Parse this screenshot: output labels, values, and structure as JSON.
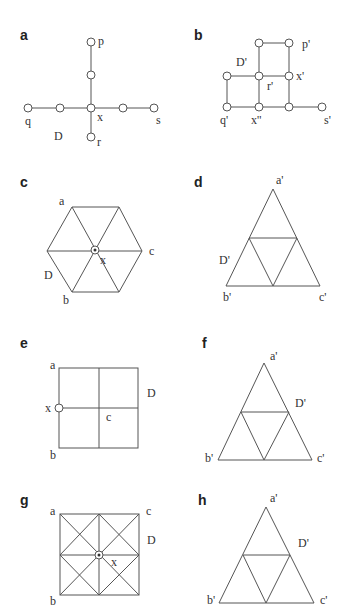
{
  "figure": {
    "panels": [
      {
        "id": "a",
        "label": "a",
        "description": "Plus-shaped graph with central vertex x",
        "vertex_labels": {
          "p": "p",
          "q": "q",
          "x": "x",
          "s": "s",
          "r": "r",
          "D": "D"
        }
      },
      {
        "id": "b",
        "label": "b",
        "description": "Grid-like graph D'",
        "vertex_labels": {
          "D": "D'",
          "p": "p'",
          "x1": "x'",
          "r": "r'",
          "q": "q'",
          "x2": "x''",
          "s": "s'"
        }
      },
      {
        "id": "c",
        "label": "c",
        "description": "Hexagon divided into six triangles, center x",
        "vertex_labels": {
          "a": "a",
          "c": "c",
          "x": "x",
          "D": "D",
          "b": "b"
        }
      },
      {
        "id": "d",
        "label": "d",
        "description": "Triangle subdivided into four triangles",
        "vertex_labels": {
          "a": "a'",
          "D": "D'",
          "b": "b'",
          "c": "c'"
        }
      },
      {
        "id": "e",
        "label": "e",
        "description": "Square divided into four squares, x on left edge",
        "vertex_labels": {
          "a": "a",
          "D": "D",
          "x": "x",
          "c": "c",
          "b": "b"
        }
      },
      {
        "id": "f",
        "label": "f",
        "description": "Triangle subdivided into four triangles",
        "vertex_labels": {
          "a": "a'",
          "D": "D'",
          "b": "b'",
          "c": "c'"
        }
      },
      {
        "id": "g",
        "label": "g",
        "description": "Square subdivided with diagonals, center x",
        "vertex_labels": {
          "a": "a",
          "c": "c",
          "D": "D",
          "x": "x",
          "b": "b"
        }
      },
      {
        "id": "h",
        "label": "h",
        "description": "Triangle subdivided into four triangles",
        "vertex_labels": {
          "a": "a'",
          "D": "D'",
          "b": "b'",
          "c": "c'"
        }
      }
    ]
  }
}
